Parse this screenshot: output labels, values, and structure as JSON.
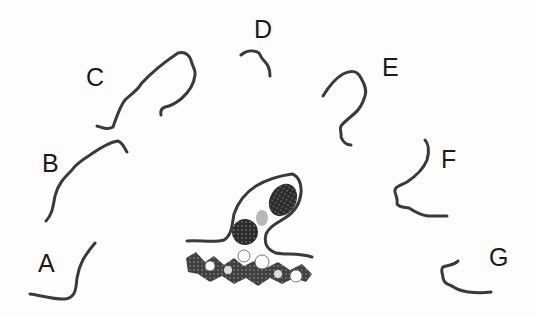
{
  "diagram": {
    "labels": [
      {
        "id": "A",
        "text": "A",
        "x": 38,
        "y": 272
      },
      {
        "id": "B",
        "text": "B",
        "x": 42,
        "y": 172
      },
      {
        "id": "C",
        "text": "C",
        "x": 86,
        "y": 86
      },
      {
        "id": "D",
        "text": "D",
        "x": 254,
        "y": 38
      },
      {
        "id": "E",
        "text": "E",
        "x": 382,
        "y": 76
      },
      {
        "id": "F",
        "text": "F",
        "x": 441,
        "y": 168
      },
      {
        "id": "G",
        "text": "G",
        "x": 489,
        "y": 266
      }
    ],
    "curves": [
      {
        "id": "A",
        "d": "M30,294 C40,295 55,300 65,299 C75,298 76,290 77,278 C79,265 84,256 95,243"
      },
      {
        "id": "B",
        "d": "M46,221 C52,215 53,207 55,196 C58,184 64,178 72,170 C76,164 82,160 90,155 C100,148 110,142 118,141 C122,142 124,147 127,152"
      },
      {
        "id": "C",
        "d": "M97,126 C103,128 108,130 113,127 C117,116 120,106 125,100 C131,94 138,90 141,84 C150,74 160,65 178,53 C185,51 189,55 191,60 C192,66 196,70 195,75 C194,84 188,93 181,99 C176,103 170,106 165,107 C162,108 160,110 161,115"
      },
      {
        "id": "D",
        "d": "M241,55 C247,50 254,50 259,53 C262,60 266,62 268,66 C270,70 270,73 270,76"
      },
      {
        "id": "E",
        "d": "M323,96 C329,86 336,78 343,74 C351,70 357,70 361,78 C365,85 367,90 365,96 C363,103 360,109 354,114 C348,119 343,123 341,126 C339,130 342,133 341,137 C343,142 346,145 351,145"
      },
      {
        "id": "F",
        "d": "M425,140 C428,143 430,150 427,160 C423,170 416,176 407,182 C399,186 394,187 395,192 C396,196 398,200 397,204 C400,208 405,207 409,208 C415,212 420,215 428,216 C435,216 440,216 447,216"
      },
      {
        "id": "G",
        "d": "M458,261 C455,265 448,265 443,267 C440,270 443,274 443,278 C444,283 447,284 452,286 C456,289 461,291 468,292 C476,293 484,293 491,292"
      }
    ],
    "central_structure": {
      "outline": "M187,241 C200,240 215,243 224,240 C232,235 232,225 234,214 C238,202 245,193 256,186 C266,180 278,176 292,174 C298,176 302,183 301,193 C300,203 296,211 285,218 C277,223 270,226 266,234 C264,243 266,249 276,253 C288,255 298,253 312,257"
    }
  }
}
